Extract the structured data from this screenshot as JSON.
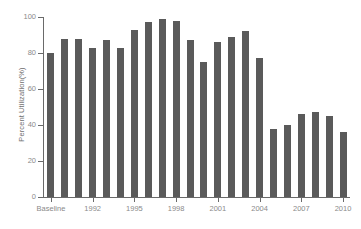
{
  "chart_data": {
    "type": "bar",
    "title": "",
    "xlabel": "",
    "ylabel": "Percent Utilization(%)",
    "ylim": [
      0,
      100
    ],
    "ytick_labels": [
      "100",
      "80",
      "60",
      "40",
      "20",
      "0"
    ],
    "ytick_values": [
      100,
      80,
      60,
      40,
      20,
      0
    ],
    "xtick_labels": [
      "Baseline",
      "1992",
      "1995",
      "1998",
      "2001",
      "2004",
      "2007",
      "2010"
    ],
    "grid": false,
    "legend": "none",
    "bar_color": "#5a5a5a",
    "axis_color": "#6a6a6a",
    "categories": [
      "Baseline",
      "1990",
      "1991",
      "1992",
      "1993",
      "1994",
      "1995",
      "1996",
      "1997",
      "1998",
      "1999",
      "2000",
      "2001",
      "2002",
      "2003",
      "2004",
      "2005",
      "2006",
      "2007",
      "2008",
      "2009",
      "2010"
    ],
    "values": [
      80,
      88,
      88,
      83,
      87,
      83,
      93,
      97,
      99,
      98,
      87,
      75,
      86,
      89,
      92,
      77,
      38,
      40,
      46,
      47,
      45,
      36
    ]
  }
}
